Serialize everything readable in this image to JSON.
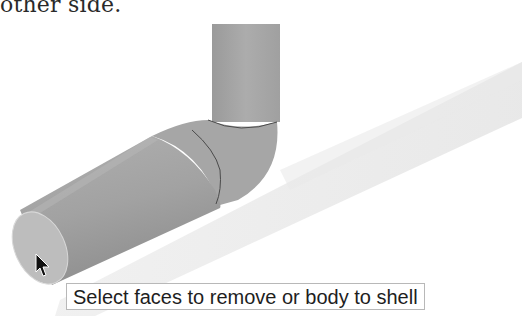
{
  "document": {
    "caption_fragment": "other side."
  },
  "viewport": {
    "model": "pipe-elbow-solid",
    "tooltip": "Select faces to remove or body to shell",
    "colors": {
      "pipe_fill": "#a8a8a8",
      "pipe_dark": "#8e8e8e",
      "end_face": "#bdbdbd",
      "edge_line": "#4a4a4a",
      "shadow": "#ececec"
    }
  },
  "cursor": {
    "icon": "arrow-pointer-icon"
  }
}
